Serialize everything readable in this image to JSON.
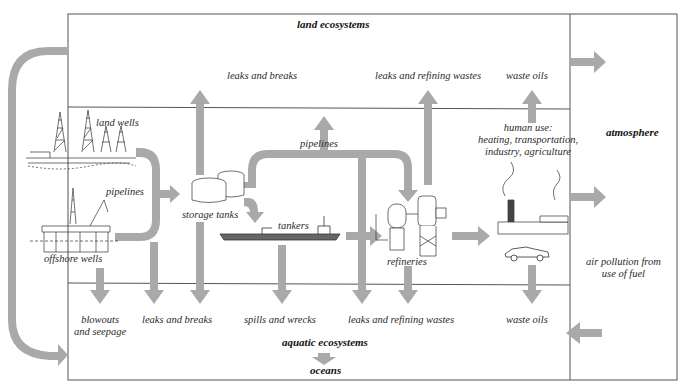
{
  "colors": {
    "arrow": "#a9a9a9",
    "line": "#555555",
    "drawing": "#333333",
    "background": "#ffffff"
  },
  "regions": {
    "land": "land ecosystems",
    "atmosphere": "atmosphere",
    "aquatic": "aquatic ecosystems",
    "oceans": "oceans"
  },
  "sources": {
    "land_wells": "land wells",
    "offshore_wells": "offshore wells",
    "pipelines_left": "pipelines",
    "storage_tanks": "storage tanks",
    "pipelines_top": "pipelines",
    "tankers": "tankers",
    "refineries": "refineries",
    "human_use": "human use:\nheating, transportation,\nindustry, agriculture"
  },
  "land_releases": {
    "leaks_breaks": "leaks and breaks",
    "leaks_refining": "leaks and refining wastes",
    "waste_oils": "waste oils"
  },
  "aquatic_releases": {
    "blowouts": "blowouts\nand seepage",
    "leaks_breaks": "leaks and breaks",
    "spills_wrecks": "spills and wrecks",
    "leaks_refining": "leaks and refining wastes",
    "waste_oils": "waste oils"
  },
  "atmosphere_releases": {
    "air_pollution": "air pollution from\nuse of fuel"
  }
}
